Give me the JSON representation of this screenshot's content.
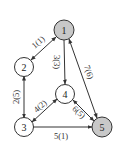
{
  "diagram": {
    "type": "directed-graph",
    "colors": {
      "highlight_fill": "#c8c8c8",
      "normal_fill": "#ffffff",
      "stroke": "#333333"
    },
    "nodes": [
      {
        "id": "1",
        "label": "1",
        "x": 64,
        "y": 30,
        "highlighted": true
      },
      {
        "id": "2",
        "label": "2",
        "x": 24,
        "y": 67,
        "highlighted": false
      },
      {
        "id": "3",
        "label": "3",
        "x": 24,
        "y": 127,
        "highlighted": false
      },
      {
        "id": "4",
        "label": "4",
        "x": 65,
        "y": 94,
        "highlighted": false
      },
      {
        "id": "5",
        "label": "5",
        "x": 102,
        "y": 127,
        "highlighted": true
      }
    ],
    "edges": [
      {
        "from": "1",
        "to": "2",
        "label": "1(1)",
        "bidirectional": true
      },
      {
        "from": "1",
        "to": "4",
        "label": "3(3)",
        "bidirectional": false
      },
      {
        "from": "1",
        "to": "5",
        "label": "7(6)",
        "bidirectional": true
      },
      {
        "from": "2",
        "to": "3",
        "label": "2(5)",
        "bidirectional": true
      },
      {
        "from": "3",
        "to": "4",
        "label": "4(2)",
        "bidirectional": true
      },
      {
        "from": "4",
        "to": "5",
        "label": "6(5)",
        "bidirectional": true
      },
      {
        "from": "3",
        "to": "5",
        "label": "5(1)",
        "bidirectional": false
      }
    ]
  }
}
